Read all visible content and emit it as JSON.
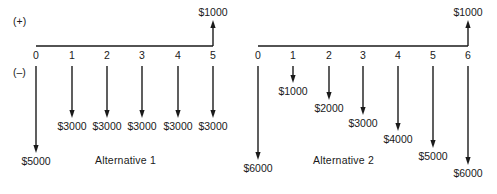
{
  "sign_labels": {
    "positive": "(+)",
    "negative": "(–)"
  },
  "alternatives": [
    {
      "caption": "Alternative 1",
      "axis_y": 46,
      "periods": [
        {
          "t": "0",
          "x": 36,
          "flow": "$5000",
          "dir": "down",
          "tip": 153
        },
        {
          "t": "1",
          "x": 72,
          "flow": "$3000",
          "dir": "down",
          "tip": 118
        },
        {
          "t": "2",
          "x": 107,
          "flow": "$3000",
          "dir": "down",
          "tip": 118
        },
        {
          "t": "3",
          "x": 142,
          "flow": "$3000",
          "dir": "down",
          "tip": 118
        },
        {
          "t": "4",
          "x": 178,
          "flow": "$3000",
          "dir": "down",
          "tip": 118
        },
        {
          "t": "5",
          "x": 213,
          "flow": "$3000",
          "dir": "down",
          "tip": 118
        }
      ],
      "receipt": {
        "t": "5",
        "x": 213,
        "flow": "$1000",
        "dir": "up"
      }
    },
    {
      "caption": "Alternative 2",
      "axis_y": 46,
      "periods": [
        {
          "t": "0",
          "x": 258,
          "flow": "$6000",
          "dir": "down",
          "tip": 160
        },
        {
          "t": "1",
          "x": 293,
          "flow": "$1000",
          "dir": "down",
          "tip": 83
        },
        {
          "t": "2",
          "x": 329,
          "flow": "$2000",
          "dir": "down",
          "tip": 100
        },
        {
          "t": "3",
          "x": 363,
          "flow": "$3000",
          "dir": "down",
          "tip": 115
        },
        {
          "t": "4",
          "x": 398,
          "flow": "$4000",
          "dir": "down",
          "tip": 131
        },
        {
          "t": "5",
          "x": 433,
          "flow": "$5000",
          "dir": "down",
          "tip": 148
        },
        {
          "t": "6",
          "x": 468,
          "flow": "$6000",
          "dir": "down",
          "tip": 165
        }
      ],
      "receipt": {
        "t": "6",
        "x": 468,
        "flow": "$1000",
        "dir": "up"
      }
    }
  ],
  "colors": {
    "ink": "#1a1a1a",
    "background": "#ffffff"
  }
}
